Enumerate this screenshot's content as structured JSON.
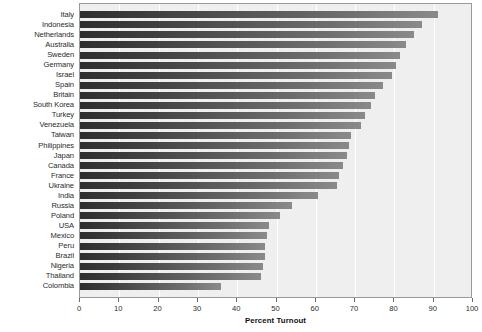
{
  "chart_data": {
    "type": "bar",
    "orientation": "horizontal",
    "title": "",
    "xlabel": "Percent Turnout",
    "ylabel": "",
    "xlim": [
      0,
      100
    ],
    "xticks": [
      0,
      10,
      20,
      30,
      40,
      50,
      60,
      70,
      80,
      90,
      100
    ],
    "grid": true,
    "legend": "none",
    "bar_color": "#555555",
    "plot_background": "#efefef",
    "categories": [
      "Italy",
      "Indonesia",
      "Netherlands",
      "Australia",
      "Sweden",
      "Germany",
      "Israel",
      "Spain",
      "Britain",
      "South Korea",
      "Turkey",
      "Venezuela",
      "Taiwan",
      "Philippines",
      "Japan",
      "Canada",
      "France",
      "Ukraine",
      "India",
      "Russia",
      "Poland",
      "USA",
      "Mexico",
      "Peru",
      "Brazil",
      "Nigeria",
      "Thailand",
      "Colombia"
    ],
    "values": [
      91.0,
      87.0,
      85.0,
      83.0,
      81.5,
      80.5,
      79.5,
      77.0,
      75.0,
      74.0,
      72.5,
      71.5,
      69.0,
      68.5,
      68.0,
      67.0,
      66.0,
      65.5,
      60.5,
      54.0,
      51.0,
      48.0,
      47.5,
      47.0,
      47.0,
      46.5,
      46.0,
      36.0
    ]
  }
}
